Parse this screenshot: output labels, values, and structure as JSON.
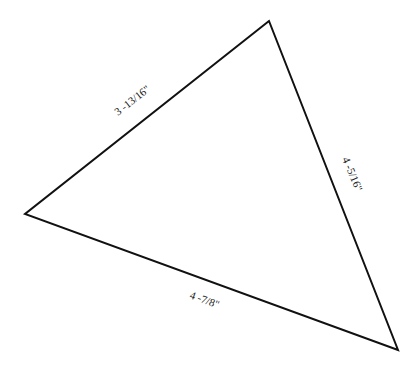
{
  "diagram": {
    "shape": "triangle",
    "stroke_color": "#111111",
    "vertices": {
      "top": [
        269,
        21
      ],
      "left": [
        25,
        214
      ],
      "bottom_right": [
        398,
        350
      ]
    },
    "sides": [
      {
        "id": "left-top",
        "label": "3 -13/16\""
      },
      {
        "id": "top-right",
        "label": "4 -5/16\""
      },
      {
        "id": "bottom",
        "label": "4 -7/8\""
      }
    ]
  }
}
